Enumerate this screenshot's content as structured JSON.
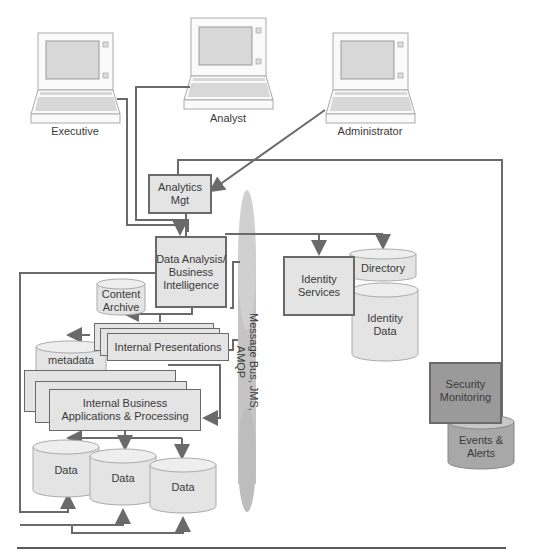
{
  "diagram": {
    "users": [
      {
        "label": "Executive"
      },
      {
        "label": "Analyst"
      },
      {
        "label": "Administrator"
      }
    ],
    "components": {
      "analytics_mgt": "Analytics\nMgt",
      "data_analysis": "Data Analysis/\nBusiness\nIntelligence",
      "content_archive": "Content\nArchive",
      "internal_presentations": "Internal Presentations",
      "metadata": "metadata",
      "internal_business": "Internal Business\nApplications & Processing",
      "data_stores": [
        "Data",
        "Data",
        "Data"
      ],
      "message_bus": "Message Bus, JMS, AMQP",
      "identity_services": "Identity\nServices",
      "directory": "Directory",
      "identity_data": "Identity\nData",
      "security_monitoring": "Security\nMonitoring",
      "events_alerts": "Events &\nAlerts"
    },
    "colors": {
      "box_fill": "#e4e4e4",
      "line": "#6a6a6a",
      "security_fill": "#9a9a9a",
      "events_fill": "#a8a8a8",
      "bus_fill": "#c4c4c4"
    }
  }
}
